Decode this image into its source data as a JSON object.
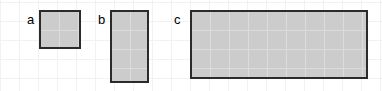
{
  "figure": {
    "background_color": "#ffffff",
    "grid_color": "#f2f2f2",
    "grid_cell_px": 19,
    "fill_color": "#cccccc",
    "border_color": "#2b2b2b",
    "inner_grid_color": "#dcdcdc"
  },
  "chart_data": {
    "type": "table",
    "title": "",
    "subtitle": "",
    "xlabel": "",
    "ylabel": "",
    "grid": true,
    "legend": "none",
    "unit": "grid square",
    "categories": [
      "a",
      "b",
      "c"
    ],
    "series": [
      {
        "name": "width_cells",
        "values": [
          2,
          2,
          9
        ]
      },
      {
        "name": "height_cells",
        "values": [
          2,
          4,
          4
        ]
      },
      {
        "name": "area_cells",
        "values": [
          4,
          8,
          36
        ]
      }
    ],
    "annotations": [
      "a",
      "b",
      "c"
    ]
  },
  "shapes": [
    {
      "label": "a",
      "name": "rectangle-a",
      "width_cells": 2,
      "height_cells": 2,
      "area_cells": 4,
      "left": 39,
      "top": 10,
      "width": 42,
      "height": 39,
      "label_left": 27,
      "label_top": 13
    },
    {
      "label": "b",
      "name": "rectangle-b",
      "width_cells": 2,
      "height_cells": 4,
      "area_cells": 8,
      "left": 110,
      "top": 10,
      "width": 39,
      "height": 73,
      "label_left": 98,
      "label_top": 13
    },
    {
      "label": "c",
      "name": "rectangle-c",
      "width_cells": 9,
      "height_cells": 4,
      "area_cells": 36,
      "left": 190,
      "top": 10,
      "width": 178,
      "height": 69,
      "label_left": 174,
      "label_top": 13
    }
  ]
}
